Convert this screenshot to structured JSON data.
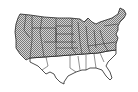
{
  "map": {
    "subject": "Contiguous United States",
    "legend": [],
    "regions": [
      {
        "name": "northern-states",
        "fill": "hatched",
        "color": "#9a9a9a"
      },
      {
        "name": "southern-states",
        "fill": "none",
        "color": "#ffffff"
      }
    ],
    "colors": {
      "background": "#ffffff",
      "outline": "#222222",
      "hatch": "#8c8c8c",
      "hatch_bg": "#d0d0d0"
    }
  }
}
